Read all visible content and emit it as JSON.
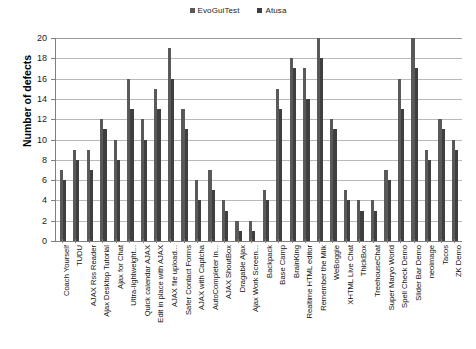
{
  "legend": {
    "position": "top-center",
    "items": [
      {
        "label": "EvoGuiTest",
        "color": "#595959"
      },
      {
        "label": "Atusa",
        "color": "#3f3f3f"
      }
    ]
  },
  "axes": {
    "ylabel": "Number of defects",
    "yticks": [
      "0",
      "2",
      "4",
      "6",
      "8",
      "10",
      "12",
      "14",
      "16",
      "18",
      "20"
    ],
    "xlabel": ""
  },
  "chart_data": {
    "type": "bar",
    "title": "",
    "xlabel": "",
    "ylabel": "Number of defects",
    "ylim": [
      0,
      20
    ],
    "ytick_step": 2,
    "grid": true,
    "legend_position": "top-center",
    "categories": [
      "Coach Yourself",
      "TUDU",
      "AJAX Rss Reader",
      "Ajax Desktop Tutorial",
      "Ajax for Chat",
      "Ultra-lightweight...",
      "Quick calendar AJAX",
      "Edit in place with AJAX",
      "AJAX file upload...",
      "Safer Contact Forms",
      "AJAX with Captcha",
      "AutoCompleter in...",
      "AJAX ShoutBox",
      "Dragable Ajax",
      "Ajax Work Screen...",
      "Backpack",
      "Base Camp",
      "BrainKing",
      "Realtime HTML editor",
      "Remember the Milk",
      "WeBoggle",
      "XHTML Live Chat",
      "ThickBox",
      "TreehouseChat",
      "Super Maryo World",
      "Spell Check Demo",
      "Slider Bar Demo",
      "neoimage",
      "Tacos",
      "ZK Demo"
    ],
    "series": [
      {
        "name": "EvoGuiTest",
        "color": "#595959",
        "values": [
          7,
          9,
          9,
          12,
          10,
          16,
          12,
          15,
          19,
          13,
          6,
          7,
          4,
          2,
          2,
          5,
          15,
          18,
          17,
          20,
          12,
          5,
          4,
          4,
          7,
          16,
          20,
          9,
          12,
          10
        ]
      },
      {
        "name": "Atusa",
        "color": "#3f3f3f",
        "values": [
          6,
          8,
          7,
          11,
          8,
          13,
          10,
          13,
          16,
          11,
          4,
          5,
          3,
          1,
          1,
          4,
          13,
          17,
          14,
          18,
          11,
          4,
          3,
          3,
          6,
          13,
          17,
          8,
          11,
          9
        ]
      }
    ]
  }
}
